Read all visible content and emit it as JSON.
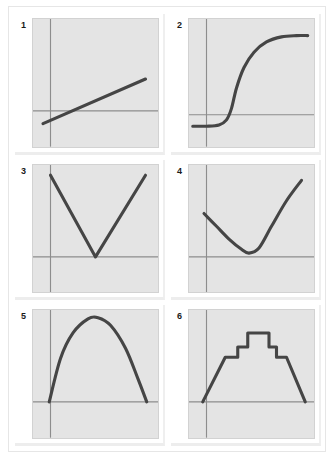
{
  "page": {
    "background_color": "#ffffff",
    "panel_background_color": "#e4e4e4",
    "curve_color": "#454545",
    "axis_color": "#8d8d8d"
  },
  "panels": [
    {
      "number": "1",
      "name": "increasing-linear",
      "axis": {
        "x_axis_y": 72,
        "y_axis_x": 14
      },
      "chart_data": {
        "type": "line",
        "title": "",
        "xlabel": "",
        "ylabel": "",
        "xlim": [
          0,
          100
        ],
        "ylim": [
          0,
          100
        ],
        "grid": false,
        "legend": "none",
        "x": [
          8,
          90
        ],
        "y": [
          18,
          53
        ]
      }
    },
    {
      "number": "2",
      "name": "sigmoid",
      "axis": {
        "x_axis_y": 75,
        "y_axis_x": 14
      },
      "chart_data": {
        "type": "line",
        "title": "",
        "xlabel": "",
        "ylabel": "",
        "xlim": [
          0,
          100
        ],
        "ylim": [
          0,
          100
        ],
        "grid": false,
        "legend": "none",
        "x": [
          3,
          14,
          24,
          30,
          34,
          38,
          44,
          52,
          62,
          74,
          86,
          95
        ],
        "y": [
          16,
          16,
          17,
          21,
          30,
          46,
          62,
          74,
          82,
          86,
          87,
          87
        ]
      }
    },
    {
      "number": "3",
      "name": "v-shape",
      "axis": {
        "x_axis_y": 72,
        "y_axis_x": 14
      },
      "chart_data": {
        "type": "line",
        "title": "",
        "xlabel": "",
        "ylabel": "",
        "xlim": [
          0,
          100
        ],
        "ylim": [
          0,
          100
        ],
        "grid": false,
        "legend": "none",
        "x": [
          14,
          50,
          90
        ],
        "y": [
          92,
          28,
          92
        ]
      }
    },
    {
      "number": "4",
      "name": "u-shape",
      "axis": {
        "x_axis_y": 72,
        "y_axis_x": 14
      },
      "chart_data": {
        "type": "line",
        "title": "",
        "xlabel": "",
        "ylabel": "",
        "xlim": [
          0,
          100
        ],
        "ylim": [
          0,
          100
        ],
        "grid": false,
        "legend": "none",
        "x": [
          12,
          22,
          32,
          42,
          48,
          56,
          66,
          78,
          90
        ],
        "y": [
          62,
          52,
          42,
          34,
          31,
          35,
          52,
          72,
          88
        ]
      }
    },
    {
      "number": "5",
      "name": "downward-parabola",
      "axis": {
        "x_axis_y": 72,
        "y_axis_x": 14
      },
      "chart_data": {
        "type": "line",
        "title": "",
        "xlabel": "",
        "ylabel": "",
        "xlim": [
          0,
          100
        ],
        "ylim": [
          0,
          100
        ],
        "grid": false,
        "legend": "none",
        "x": [
          13,
          22,
          32,
          44,
          52,
          62,
          74,
          84,
          91
        ],
        "y": [
          28,
          62,
          82,
          93,
          94,
          88,
          70,
          46,
          28
        ]
      }
    },
    {
      "number": "6",
      "name": "step-ramp",
      "axis": {
        "x_axis_y": 72,
        "y_axis_x": 14
      },
      "chart_data": {
        "type": "line",
        "title": "",
        "xlabel": "",
        "ylabel": "",
        "xlim": [
          0,
          100
        ],
        "ylim": [
          0,
          100
        ],
        "grid": false,
        "legend": "none",
        "x": [
          11,
          29,
          29,
          39,
          39,
          47,
          47,
          64,
          64,
          70,
          70,
          78,
          78,
          93
        ],
        "y": [
          28,
          63,
          63,
          63,
          71,
          71,
          82,
          82,
          71,
          71,
          63,
          63,
          63,
          28
        ]
      }
    }
  ]
}
